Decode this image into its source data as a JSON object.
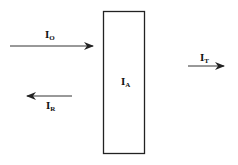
{
  "diagram": {
    "title": "",
    "labels": {
      "incident": {
        "main": "I",
        "sub": "O"
      },
      "reflected": {
        "main": "I",
        "sub": "R"
      },
      "absorbed": {
        "main": "I",
        "sub": "A"
      },
      "transmitted": {
        "main": "I",
        "sub": "T"
      }
    },
    "colors": {
      "stroke": "#222222",
      "background": "#ffffff"
    }
  }
}
